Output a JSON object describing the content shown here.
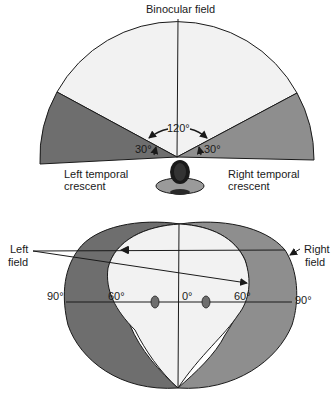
{
  "top_diagram": {
    "title": "Binocular field",
    "angle_center": "120°",
    "angle_left": "30°",
    "angle_right": "30°",
    "left_label_line1": "Left temporal",
    "left_label_line2": "crescent",
    "right_label_line1": "Right temporal",
    "right_label_line2": "crescent"
  },
  "bottom_diagram": {
    "left_label_line1": "Left",
    "left_label_line2": "field",
    "right_label_line1": "Right",
    "right_label_line2": "field",
    "tick_left_90": "90°",
    "tick_left_60": "60°",
    "tick_center_0": "0°",
    "tick_right_60": "60°",
    "tick_right_90": "90°"
  },
  "colors": {
    "binocular_fill": "#f2f2f2",
    "left_region_fill": "#6e6e6e",
    "right_region_fill": "#8e8e8e",
    "stroke": "#1a1a1a"
  }
}
